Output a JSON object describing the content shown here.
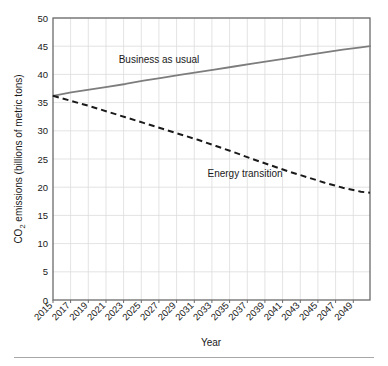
{
  "chart_data": {
    "type": "line",
    "title": "",
    "xlabel": "Year",
    "ylabel": "CO2 emissions (billions of metric tons)",
    "ylabel_prefix": "CO",
    "ylabel_subscript": "2",
    "ylabel_suffix": " emissions (billions of  metric tons)",
    "xlim": [
      2015,
      2050
    ],
    "ylim": [
      0,
      50
    ],
    "grid": true,
    "legend_position": "inline-annotations",
    "categories": [
      2015,
      2017,
      2019,
      2021,
      2023,
      2025,
      2027,
      2029,
      2031,
      2033,
      2035,
      2037,
      2039,
      2041,
      2043,
      2045,
      2047,
      2049
    ],
    "xtick_labels": [
      "2015",
      "2017",
      "2019",
      "2021",
      "2023",
      "2025",
      "2027",
      "2029",
      "2031",
      "2033",
      "2035",
      "2037",
      "2039",
      "2041",
      "2043",
      "2045",
      "2047",
      "2049"
    ],
    "ytick_labels": [
      "0",
      "5",
      "10",
      "15",
      "20",
      "25",
      "30",
      "35",
      "40",
      "45",
      "50"
    ],
    "ytick_values": [
      0,
      5,
      10,
      15,
      20,
      25,
      30,
      35,
      40,
      45,
      50
    ],
    "series": [
      {
        "name": "Business as usual",
        "style": "solid",
        "color": "#7d7d7d",
        "x": [
          2015,
          2017,
          2019,
          2021,
          2023,
          2025,
          2027,
          2029,
          2031,
          2033,
          2035,
          2037,
          2039,
          2041,
          2043,
          2045,
          2047,
          2049,
          2050
        ],
        "values": [
          36.2,
          36.8,
          37.3,
          37.8,
          38.3,
          38.9,
          39.4,
          39.9,
          40.4,
          40.9,
          41.4,
          41.9,
          42.4,
          42.9,
          43.4,
          43.9,
          44.4,
          44.8,
          45.0
        ]
      },
      {
        "name": "Energy transition",
        "style": "dashed",
        "color": "#1a1a1a",
        "x": [
          2015,
          2017,
          2019,
          2021,
          2023,
          2025,
          2027,
          2029,
          2031,
          2033,
          2035,
          2037,
          2039,
          2041,
          2043,
          2045,
          2047,
          2049,
          2050
        ],
        "values": [
          36.2,
          35.3,
          34.4,
          33.4,
          32.4,
          31.4,
          30.4,
          29.4,
          28.4,
          27.3,
          26.2,
          25.0,
          23.9,
          22.8,
          21.8,
          20.8,
          19.9,
          19.2,
          19.0
        ]
      }
    ],
    "annotations": [
      {
        "text": "Business as usual",
        "x": 2022.4,
        "y": 42.6
      },
      {
        "text": "Energy transition",
        "x": 2032.0,
        "y": 23.6
      }
    ],
    "colors": {
      "business_as_usual": "#7d7d7d",
      "energy_transition": "#1a1a1a",
      "grid": "#d9d9d9",
      "axis": "#5a5a5a",
      "text": "#1a1a1a",
      "rule": "#a8a8a8"
    }
  }
}
